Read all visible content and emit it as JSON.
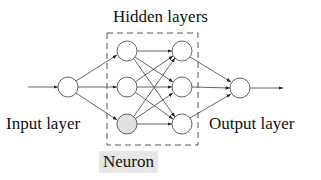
{
  "labels": {
    "hidden_layers": "Hidden layers",
    "input_layer": "Input layer",
    "output_layer": "Output layer",
    "neuron": "Neuron"
  },
  "colors": {
    "stroke": "#555555",
    "node_fill": "#ffffff",
    "highlight_fill": "#e0e0e0",
    "neuron_label_bg": "#e6e6e6"
  },
  "network": {
    "input_nodes": 1,
    "hidden_layers": [
      3,
      3
    ],
    "output_nodes": 1,
    "highlighted_node": "hidden-layer-1-node-3"
  }
}
